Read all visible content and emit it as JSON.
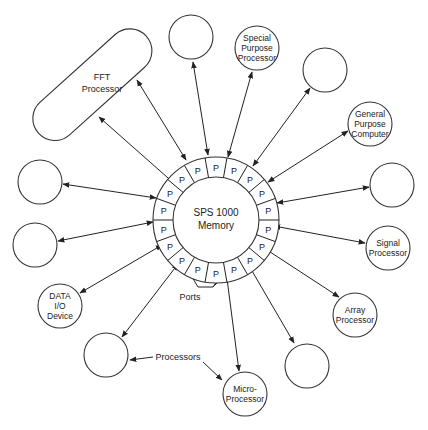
{
  "diagram": {
    "title": "SPS 1000 Memory",
    "center": {
      "line1": "SPS 1000",
      "line2": "Memory"
    },
    "port_label": "P",
    "port_count": 18,
    "annotations": {
      "ports": "Ports",
      "processors": "Processors"
    },
    "nodes": [
      {
        "id": "fft",
        "lines": [
          "FFT",
          "Processor"
        ]
      },
      {
        "id": "top-left-circle",
        "lines": []
      },
      {
        "id": "special-purpose",
        "lines": [
          "Special",
          "Purpose",
          "Processor"
        ]
      },
      {
        "id": "top-right-circle",
        "lines": []
      },
      {
        "id": "general-purpose",
        "lines": [
          "General",
          "Purpose",
          "Computer"
        ]
      },
      {
        "id": "right-circle",
        "lines": []
      },
      {
        "id": "signal",
        "lines": [
          "Signal",
          "Processor"
        ]
      },
      {
        "id": "array",
        "lines": [
          "Array",
          "Processor"
        ]
      },
      {
        "id": "bottom-right-circle",
        "lines": []
      },
      {
        "id": "micro",
        "lines": [
          "Micro-",
          "Processor"
        ]
      },
      {
        "id": "bottom-left-circle",
        "lines": []
      },
      {
        "id": "data-io",
        "lines": [
          "DATA",
          "I/O",
          "Device"
        ]
      },
      {
        "id": "left-lower-circle",
        "lines": []
      },
      {
        "id": "left-upper-circle",
        "lines": []
      }
    ]
  }
}
